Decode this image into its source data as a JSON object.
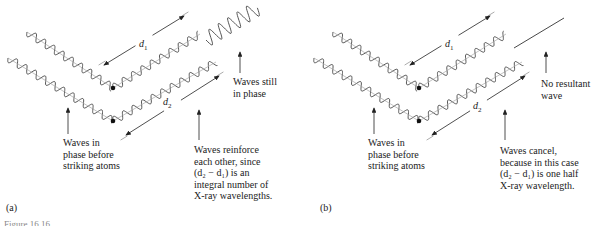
{
  "figure": {
    "caption_partial": "Figure 16.16",
    "panels": [
      {
        "id": "a",
        "panel_label": "(a)",
        "distance_labels": {
          "d1": "d",
          "d1_sub": "1",
          "d2": "d",
          "d2_sub": "2"
        },
        "annotations": {
          "incoming": [
            "Waves in",
            "phase before",
            "striking atoms"
          ],
          "outgoing": [
            "Waves still",
            "in phase"
          ],
          "explanation": [
            "Waves reinforce",
            "each other, since",
            "(d₂ − d₁) is an",
            "integral number of",
            "X-ray wavelengths."
          ]
        }
      },
      {
        "id": "b",
        "panel_label": "(b)",
        "distance_labels": {
          "d1": "d",
          "d1_sub": "1",
          "d2": "d",
          "d2_sub": "2"
        },
        "annotations": {
          "incoming": [
            "Waves in",
            "phase before",
            "striking atoms"
          ],
          "outgoing": [
            "No resultant",
            "wave"
          ],
          "explanation": [
            "Waves cancel,",
            "because in this case",
            "(d₂ − d₁) is one half",
            "X-ray wavelength."
          ]
        }
      }
    ]
  }
}
